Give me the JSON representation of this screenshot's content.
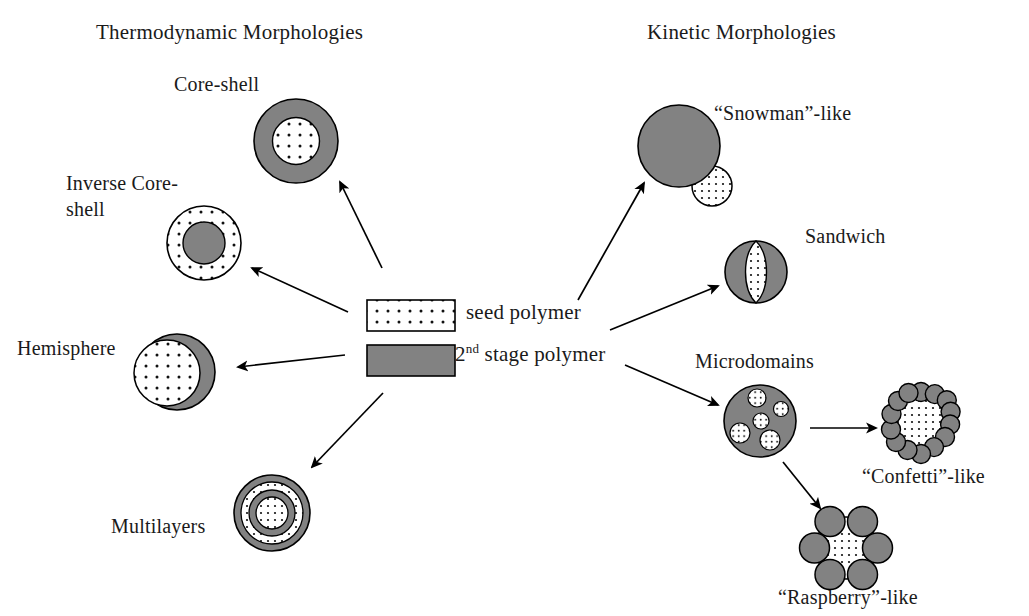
{
  "figure": {
    "section_titles": {
      "left": "Thermodynamic Morphologies",
      "right": "Kinetic Morphologies"
    },
    "legend": {
      "seed": {
        "label": "seed polymer",
        "fill": "seed-dotted-white"
      },
      "second_stage": {
        "label_prefix": "2",
        "label_sup": "nd",
        "label_suffix": " stage polymer",
        "label_full": "2nd stage polymer",
        "fill": "solid-gray"
      }
    },
    "colors": {
      "gray_polymer": "#808080",
      "gray_polymer_light": "#8c8c8c",
      "seed_white": "#ffffff",
      "outline": "#000000",
      "text": "#1a1a1a",
      "background": "#ffffff"
    },
    "thermodynamic_items": [
      {
        "id": "core-shell",
        "label": "Core-shell"
      },
      {
        "id": "inverse-core-shell",
        "label": "Inverse Core-\nshell",
        "label_line1": "Inverse Core-",
        "label_line2": "shell"
      },
      {
        "id": "hemisphere",
        "label": "Hemisphere"
      },
      {
        "id": "multilayers",
        "label": "Multilayers"
      }
    ],
    "kinetic_items": [
      {
        "id": "snowman",
        "label": "“Snowman”-like"
      },
      {
        "id": "sandwich",
        "label": "Sandwich"
      },
      {
        "id": "microdomains",
        "label": "Microdomains"
      },
      {
        "id": "confetti",
        "label": "“Confetti”-like"
      },
      {
        "id": "raspberry",
        "label": "“Raspberry”-like"
      }
    ]
  }
}
